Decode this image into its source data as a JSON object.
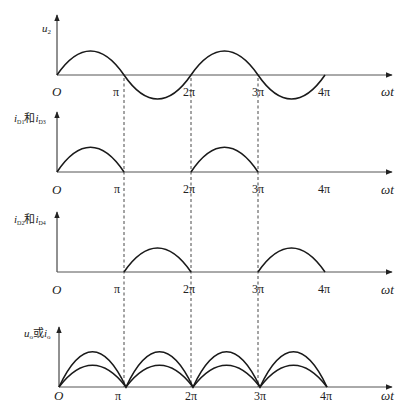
{
  "figure": {
    "x_axis_label": "ωt",
    "origin_label": "O",
    "tick_labels": [
      "π",
      "2π",
      "3π",
      "4π"
    ],
    "colors": {
      "curve": "#1a1a1a",
      "axis": "#333333",
      "dashed": "#333333",
      "background": "#ffffff"
    }
  },
  "panels": [
    {
      "id": "u2",
      "y_label_main": "u",
      "y_label_sub": "2",
      "curve": "full sine, 0 to 4π"
    },
    {
      "id": "iD1-iD3",
      "y_label_main_a": "i",
      "y_label_sub_a": "D1",
      "joiner": "和",
      "y_label_main_b": "i",
      "y_label_sub_b": "D3",
      "curve": "positive half-sine on [0,π] and [2π,3π]"
    },
    {
      "id": "iD2-iD4",
      "y_label_main_a": "i",
      "y_label_sub_a": "D2",
      "joiner": "和",
      "y_label_main_b": "i",
      "y_label_sub_b": "D4",
      "curve": "positive half-sine on [π,2π] and [3π,4π]"
    },
    {
      "id": "uo-io",
      "y_label_main_a": "u",
      "y_label_sub_a": "o",
      "joiner": "或",
      "y_label_main_b": "i",
      "y_label_sub_b": "o",
      "curve": "two full-wave rectified sine arches (larger and smaller amplitude) on [0,4π]"
    }
  ]
}
